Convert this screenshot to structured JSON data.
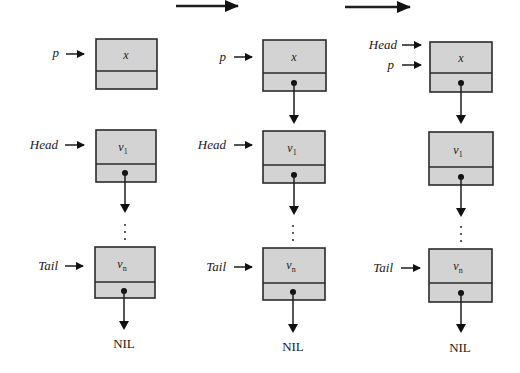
{
  "diagram": {
    "type": "linked-list-insert-at-head",
    "step_arrows": [
      {
        "from": "col1",
        "to": "col2"
      },
      {
        "from": "col2",
        "to": "col3"
      }
    ],
    "columns": [
      {
        "id": "col1",
        "nodes": [
          {
            "value": "x",
            "pointer_labels": [
              "p"
            ],
            "next": null
          },
          {
            "value": "v",
            "subscript": "1",
            "pointer_labels": [
              "Head"
            ],
            "next": "…"
          },
          {
            "value": "v",
            "subscript": "n",
            "pointer_labels": [
              "Tail"
            ],
            "next": "NIL"
          }
        ]
      },
      {
        "id": "col2",
        "nodes": [
          {
            "value": "x",
            "pointer_labels": [
              "p"
            ],
            "next": "v1"
          },
          {
            "value": "v",
            "subscript": "1",
            "pointer_labels": [
              "Head"
            ],
            "next": "…"
          },
          {
            "value": "v",
            "subscript": "n",
            "pointer_labels": [
              "Tail"
            ],
            "next": "NIL"
          }
        ]
      },
      {
        "id": "col3",
        "nodes": [
          {
            "value": "x",
            "pointer_labels": [
              "Head",
              "p"
            ],
            "next": "v1"
          },
          {
            "value": "v",
            "subscript": "1",
            "pointer_labels": [],
            "next": "…"
          },
          {
            "value": "v",
            "subscript": "n",
            "pointer_labels": [
              "Tail"
            ],
            "next": "NIL"
          }
        ]
      }
    ],
    "labels": {
      "p": "p",
      "head": "Head",
      "tail": "Tail",
      "x": "x",
      "v": "v",
      "sub1": "1",
      "subn": "n",
      "nil": "NIL",
      "ellipsis": "⋮"
    },
    "colors": {
      "node_fill": "#d3d3d3",
      "stroke": "#2b2b2b",
      "background": "#ffffff"
    }
  }
}
